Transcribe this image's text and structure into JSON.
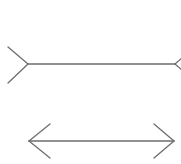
{
  "diagram": {
    "type": "muller-lyer-illusion",
    "stroke_color": "#6e6e6e",
    "background": "#ffffff",
    "figures": [
      {
        "name": "fins-out-line",
        "shaft": {
          "x1": 28,
          "y1": 64,
          "x2": 175,
          "y2": 64
        },
        "fins": [
          {
            "x1": 8,
            "y1": 47,
            "x2": 28,
            "y2": 64
          },
          {
            "x1": 8,
            "y1": 83,
            "x2": 28,
            "y2": 64
          },
          {
            "x1": 175,
            "y1": 64,
            "x2": 183,
            "y2": 57
          },
          {
            "x1": 175,
            "y1": 64,
            "x2": 183,
            "y2": 71
          }
        ]
      },
      {
        "name": "fins-in-line",
        "shaft": {
          "x1": 29,
          "y1": 141,
          "x2": 174,
          "y2": 141
        },
        "fins": [
          {
            "x1": 29,
            "y1": 141,
            "x2": 50,
            "y2": 124
          },
          {
            "x1": 29,
            "y1": 141,
            "x2": 50,
            "y2": 158
          },
          {
            "x1": 174,
            "y1": 141,
            "x2": 154,
            "y2": 124
          },
          {
            "x1": 174,
            "y1": 141,
            "x2": 154,
            "y2": 158
          }
        ]
      }
    ]
  }
}
